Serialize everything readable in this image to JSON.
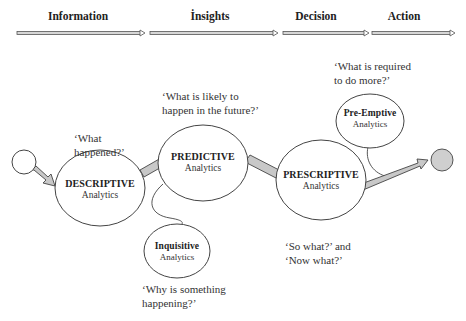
{
  "stages": [
    {
      "label": "Information",
      "x": 78
    },
    {
      "label": "İnsights",
      "x": 210
    },
    {
      "label": "Decision",
      "x": 316
    },
    {
      "label": "Action",
      "x": 404
    }
  ],
  "nodes": {
    "descriptive": {
      "title": "DESCRIPTIVE",
      "sub": "Analytics"
    },
    "predictive": {
      "title": "PREDICTIVE",
      "sub": "Analytics"
    },
    "inquisitive": {
      "title": "Inquisitive",
      "sub": "Analytics"
    },
    "prescriptive": {
      "title": "PRESCRIPTIVE",
      "sub": "Analytics"
    },
    "preemptive": {
      "title": "Pre-Emptive",
      "sub": "Analytics"
    }
  },
  "questions": {
    "what_happened": [
      "‘What",
      "happened?’"
    ],
    "what_likely": [
      "‘What is likely to",
      "happen in the future?’"
    ],
    "why_happening": [
      "‘Why is something",
      "happening?’"
    ],
    "so_what": [
      "‘So what?’ and",
      "‘Now what?’"
    ],
    "what_required": [
      "‘What is required",
      "to do more?’"
    ]
  },
  "colors": {
    "stroke": "#444444",
    "connector_fill": "#c8c8c8",
    "end_circle_fill": "#cfcfcf",
    "ellipse_fill": "#ffffff"
  }
}
